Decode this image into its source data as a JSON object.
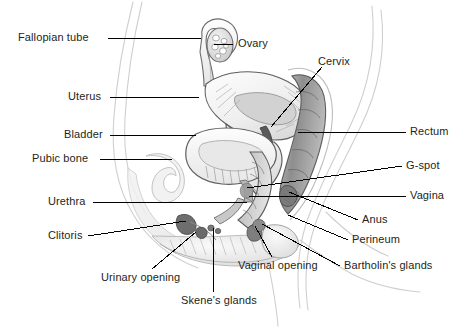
{
  "figure": {
    "background_color": "#ffffff",
    "label_color": "#231f20",
    "leader_line_color": "#000000",
    "art_stroke_color": "#4a4a4a",
    "art_shade_color": "#9a9a9a"
  },
  "labels": {
    "fallopian_tube": "Fallopian tube",
    "uterus": "Uterus",
    "bladder": "Bladder",
    "pubic_bone": "Pubic bone",
    "urethra": "Urethra",
    "clitoris": "Clitoris",
    "urinary_opening": "Urinary opening",
    "skenes_glands": "Skene's glands",
    "vaginal_opening": "Vaginal opening",
    "ovary": "Ovary",
    "cervix": "Cervix",
    "rectum": "Rectum",
    "g_spot": "G-spot",
    "vagina": "Vagina",
    "anus": "Anus",
    "perineum": "Perineum",
    "bartholins_glands": "Bartholin's glands"
  },
  "annotations": [
    {
      "key": "fallopian_tube",
      "text": "Fallopian tube",
      "side": "left",
      "label_x": 18,
      "label_y": 32,
      "line": [
        [
          108,
          38
        ],
        [
          201,
          38
        ]
      ]
    },
    {
      "key": "uterus",
      "text": "Uterus",
      "side": "left",
      "label_x": 68,
      "label_y": 91,
      "line": [
        [
          110,
          97
        ],
        [
          199,
          97
        ]
      ]
    },
    {
      "key": "bladder",
      "text": "Bladder",
      "side": "left",
      "label_x": 64,
      "label_y": 129,
      "line": [
        [
          110,
          135
        ],
        [
          196,
          135
        ]
      ]
    },
    {
      "key": "pubic_bone",
      "text": "Pubic bone",
      "side": "left",
      "label_x": 32,
      "label_y": 153,
      "line": [
        [
          100,
          159
        ],
        [
          172,
          159
        ]
      ]
    },
    {
      "key": "urethra",
      "text": "Urethra",
      "side": "left",
      "label_x": 48,
      "label_y": 196,
      "line": [
        [
          93,
          202
        ],
        [
          247,
          202
        ]
      ]
    },
    {
      "key": "clitoris",
      "text": "Clitoris",
      "side": "left",
      "label_x": 48,
      "label_y": 230,
      "line": [
        [
          88,
          236
        ],
        [
          186,
          221
        ]
      ]
    },
    {
      "key": "urinary_opening",
      "text": "Urinary opening",
      "side": "bottom",
      "label_x": 101,
      "label_y": 272,
      "line": [
        [
          152,
          269
        ],
        [
          196,
          232
        ]
      ]
    },
    {
      "key": "skenes_glands",
      "text": "Skene's glands",
      "side": "bottom",
      "label_x": 181,
      "label_y": 295,
      "line": [
        [
          213,
          292
        ],
        [
          213,
          228
        ]
      ]
    },
    {
      "key": "vaginal_opening",
      "text": "Vaginal opening",
      "side": "bottom",
      "label_x": 238,
      "label_y": 260,
      "line": [
        [
          272,
          257
        ],
        [
          255,
          226
        ]
      ]
    },
    {
      "key": "ovary",
      "text": "Ovary",
      "side": "right",
      "label_x": 238,
      "label_y": 38,
      "line": [
        [
          233,
          44
        ],
        [
          214,
          44
        ]
      ]
    },
    {
      "key": "cervix",
      "text": "Cervix",
      "side": "right",
      "label_x": 318,
      "label_y": 56,
      "line": [
        [
          322,
          67
        ],
        [
          271,
          127
        ]
      ]
    },
    {
      "key": "rectum",
      "text": "Rectum",
      "side": "right",
      "label_x": 410,
      "label_y": 126,
      "line": [
        [
          406,
          132
        ],
        [
          298,
          132
        ]
      ]
    },
    {
      "key": "g_spot",
      "text": "G-spot",
      "side": "right",
      "label_x": 406,
      "label_y": 160,
      "line": [
        [
          402,
          166
        ],
        [
          247,
          188
        ]
      ]
    },
    {
      "key": "vagina",
      "text": "Vagina",
      "side": "right",
      "label_x": 410,
      "label_y": 190,
      "line": [
        [
          406,
          196
        ],
        [
          249,
          196
        ]
      ]
    },
    {
      "key": "anus",
      "text": "Anus",
      "side": "right",
      "label_x": 362,
      "label_y": 214,
      "line": [
        [
          358,
          220
        ],
        [
          289,
          192
        ]
      ]
    },
    {
      "key": "perineum",
      "text": "Perineum",
      "side": "right",
      "label_x": 352,
      "label_y": 234,
      "line": [
        [
          348,
          240
        ],
        [
          288,
          215
        ]
      ]
    },
    {
      "key": "bartholins_glands",
      "text": "Bartholin's glands",
      "side": "right",
      "label_x": 344,
      "label_y": 260,
      "line": [
        [
          340,
          266
        ],
        [
          262,
          224
        ]
      ]
    }
  ]
}
